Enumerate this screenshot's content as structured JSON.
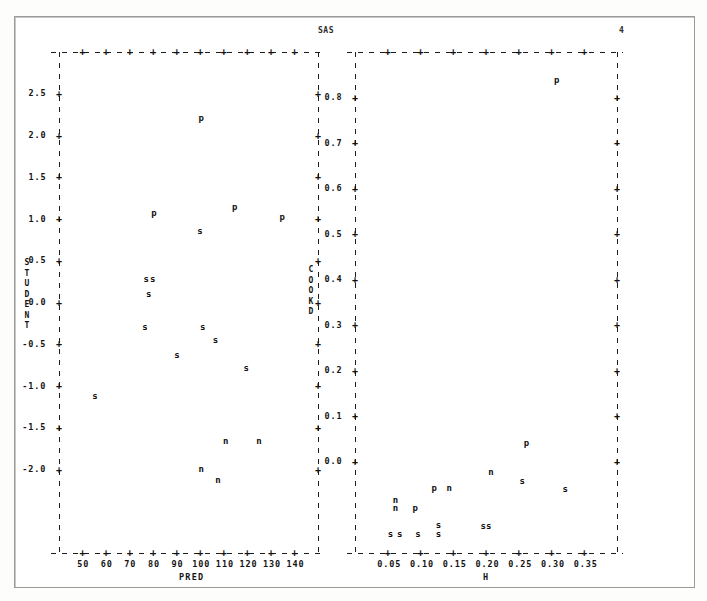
{
  "header": {
    "system_label": "SAS",
    "page_number": "4"
  },
  "panels": [
    {
      "id": "student-vs-pred",
      "x_label": "PRED",
      "y_label": "STUDENT",
      "x_ticks": [
        "50",
        "60",
        "70",
        "80",
        "90",
        "100",
        "110",
        "120",
        "130",
        "140"
      ],
      "y_ticks": [
        "2.5",
        "2.0",
        "1.5",
        "1.0",
        "0.5",
        "0.0",
        "-0.5",
        "-1.0",
        "-1.5",
        "-2.0"
      ]
    },
    {
      "id": "cookd-vs-h",
      "x_label": "H",
      "y_label": "COOKD",
      "x_ticks": [
        "0.05",
        "0.10",
        "0.15",
        "0.20",
        "0.25",
        "0.30",
        "0.35"
      ],
      "y_ticks": [
        "0.8",
        "0.7",
        "0.6",
        "0.5",
        "0.4",
        "0.3",
        "0.2",
        "0.1",
        "0.0"
      ]
    }
  ],
  "chart_data": [
    {
      "type": "scatter",
      "title": "STUDENT vs PRED",
      "xlabel": "PRED",
      "ylabel": "STUDENT",
      "xlim": [
        45,
        146
      ],
      "ylim": [
        -2.35,
        2.9
      ],
      "grid": false,
      "legend": "none",
      "marker_labels": [
        "s",
        "p",
        "n"
      ],
      "points": [
        {
          "label": "p",
          "x": 100.5,
          "y": 2.21
        },
        {
          "label": "p",
          "x": 82.0,
          "y": 1.21
        },
        {
          "label": "p",
          "x": 113.5,
          "y": 1.28
        },
        {
          "label": "p",
          "x": 132.0,
          "y": 1.17
        },
        {
          "label": "s",
          "x": 100.0,
          "y": 1.02
        },
        {
          "label": "s",
          "x": 79.0,
          "y": 0.52
        },
        {
          "label": "s",
          "x": 81.5,
          "y": 0.52
        },
        {
          "label": "s",
          "x": 80.0,
          "y": 0.36
        },
        {
          "label": "s",
          "x": 78.5,
          "y": 0.02
        },
        {
          "label": "s",
          "x": 101.0,
          "y": 0.02
        },
        {
          "label": "s",
          "x": 106.0,
          "y": -0.12
        },
        {
          "label": "s",
          "x": 91.0,
          "y": -0.28
        },
        {
          "label": "s",
          "x": 118.0,
          "y": -0.41
        },
        {
          "label": "s",
          "x": 59.0,
          "y": -0.7
        },
        {
          "label": "n",
          "x": 110.0,
          "y": -1.18
        },
        {
          "label": "n",
          "x": 123.0,
          "y": -1.18
        },
        {
          "label": "n",
          "x": 100.5,
          "y": -1.47
        },
        {
          "label": "n",
          "x": 107.0,
          "y": -1.59
        }
      ]
    },
    {
      "type": "scatter",
      "title": "COOKD vs H",
      "xlabel": "H",
      "ylabel": "COOKD",
      "xlim": [
        0.015,
        0.385
      ],
      "ylim": [
        -0.03,
        0.85
      ],
      "grid": false,
      "legend": "none",
      "marker_labels": [
        "s",
        "p",
        "n"
      ],
      "points": [
        {
          "label": "p",
          "x": 0.3,
          "y": 0.8
        },
        {
          "label": "p",
          "x": 0.257,
          "y": 0.163
        },
        {
          "label": "n",
          "x": 0.207,
          "y": 0.113
        },
        {
          "label": "s",
          "x": 0.251,
          "y": 0.097
        },
        {
          "label": "p",
          "x": 0.127,
          "y": 0.085
        },
        {
          "label": "n",
          "x": 0.148,
          "y": 0.085
        },
        {
          "label": "s",
          "x": 0.312,
          "y": 0.083
        },
        {
          "label": "n",
          "x": 0.072,
          "y": 0.063
        },
        {
          "label": "n",
          "x": 0.072,
          "y": 0.049
        },
        {
          "label": "p",
          "x": 0.1,
          "y": 0.049
        },
        {
          "label": "s",
          "x": 0.133,
          "y": 0.02
        },
        {
          "label": "s",
          "x": 0.196,
          "y": 0.017
        },
        {
          "label": "s",
          "x": 0.204,
          "y": 0.017
        },
        {
          "label": "s",
          "x": 0.065,
          "y": 0.003
        },
        {
          "label": "s",
          "x": 0.078,
          "y": 0.003
        },
        {
          "label": "s",
          "x": 0.104,
          "y": 0.003
        },
        {
          "label": "s",
          "x": 0.133,
          "y": 0.003
        }
      ]
    }
  ]
}
